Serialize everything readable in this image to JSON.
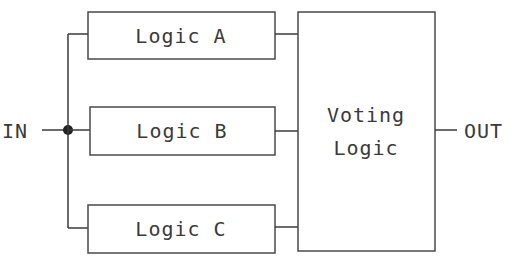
{
  "diagram": {
    "input_label": "IN",
    "output_label": "OUT",
    "blocks": [
      {
        "id": "logic-a",
        "label": "Logic A"
      },
      {
        "id": "logic-b",
        "label": "Logic B"
      },
      {
        "id": "logic-c",
        "label": "Logic C"
      }
    ],
    "voter": {
      "line1": "Voting",
      "line2": "Logic"
    },
    "colors": {
      "stroke": "#3a3a3a",
      "background": "#ffffff"
    }
  }
}
